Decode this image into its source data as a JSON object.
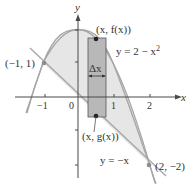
{
  "figure": {
    "axes": {
      "x_label": "x",
      "y_label": "y",
      "x_ticks": [
        "−1",
        "0",
        "1",
        "2"
      ],
      "y_ticks_count": 4
    },
    "curves": {
      "upper": {
        "label": "y = 2 − x",
        "exponent": "2"
      },
      "lower": {
        "label": "y = −x"
      }
    },
    "points": {
      "left_intersection": "(−1, 1)",
      "right_intersection": "(2, −2)",
      "top_of_strip": "(x, f(x))",
      "bottom_of_strip": "(x, g(x))"
    },
    "strip": {
      "width_label": "Δx"
    },
    "colors": {
      "region_fill": "#e6e6e6",
      "strip_fill": "#b8b8b8",
      "curve_stroke": "#a6a6a6",
      "axis_stroke": "#4a4a4a",
      "point_fill": "#8c8c8c",
      "strip_point_fill": "#222222"
    }
  }
}
